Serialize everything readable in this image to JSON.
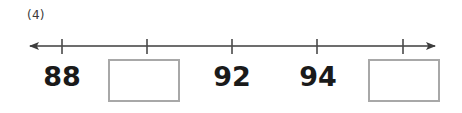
{
  "worksheet": {
    "question_number": "(4)",
    "width": 462,
    "height": 113,
    "background_color": "#ffffff"
  },
  "number_line": {
    "type": "number-line",
    "line_color": "#3d3d3d",
    "line_y": 46,
    "line_start_x": 28,
    "line_end_x": 437,
    "left_arrow": true,
    "right_arrow": true,
    "tick_color": "#4a4a4a",
    "tick_top": 39,
    "tick_bottom": 54,
    "tick_spacing": 85,
    "ticks": [
      {
        "x": 62,
        "label": "88",
        "kind": "value"
      },
      {
        "x": 147,
        "label": "",
        "kind": "blank"
      },
      {
        "x": 232,
        "label": "92",
        "kind": "value"
      },
      {
        "x": 317,
        "label": "94",
        "kind": "value"
      },
      {
        "x": 403,
        "label": "",
        "kind": "blank"
      }
    ]
  },
  "labels": [
    {
      "name": "tick-label-88",
      "text": "88",
      "x": 62
    },
    {
      "name": "tick-label-92",
      "text": "92",
      "x": 232
    },
    {
      "name": "tick-label-94",
      "text": "94",
      "x": 318
    }
  ],
  "answer_boxes": [
    {
      "name": "answer-box-1",
      "x": 144,
      "value": "",
      "border_color": "#a8a8a8"
    },
    {
      "name": "answer-box-2",
      "x": 404,
      "value": "",
      "border_color": "#a8a8a8"
    }
  ]
}
